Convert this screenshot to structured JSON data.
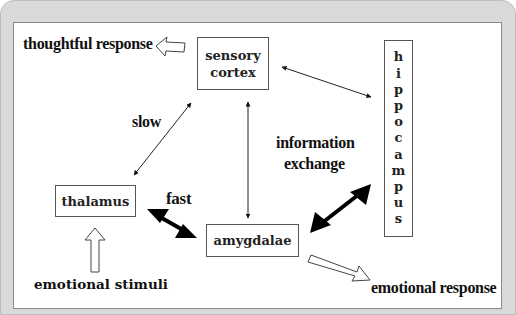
{
  "diagram": {
    "nodes": {
      "sensory_cortex": "sensory cortex",
      "hippocampus": "hippocampus",
      "thalamus": "thalamus",
      "amygdalae": "amygdalae"
    },
    "hippocampus_letters": [
      "h",
      "i",
      "p",
      "p",
      "o",
      "c",
      "a",
      "m",
      "p",
      "u",
      "s"
    ],
    "labels": {
      "thoughtful_response": "thoughtful response",
      "slow": "slow",
      "fast": "fast",
      "information": "information",
      "exchange": "exchange",
      "emotional_stimuli": "emotional stimuli",
      "emotional_response": "emotional response"
    },
    "colors": {
      "frame": "#d9d9d9",
      "panel": "#ffffff",
      "ink": "#111111"
    }
  }
}
